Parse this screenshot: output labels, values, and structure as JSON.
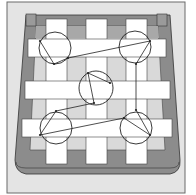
{
  "diagram": {
    "colors": {
      "background": "#ffffff",
      "panel": "#e4e4e4",
      "panel_border": "#6a6a6a",
      "frame_dark": "#8c8c8c",
      "frame_mid": "#a8a8a8",
      "slat": "#d9d9d9",
      "strap": "#ffffff",
      "line": "#222222"
    },
    "vertical_straps": [
      {
        "x": 46,
        "y": 19,
        "w": 21,
        "h": 145
      },
      {
        "x": 86,
        "y": 19,
        "w": 21,
        "h": 145
      },
      {
        "x": 126,
        "y": 19,
        "w": 21,
        "h": 145
      }
    ],
    "horizontal_straps": [
      {
        "x": 28,
        "y": 39,
        "w": 138,
        "h": 18
      },
      {
        "x": 25,
        "y": 81,
        "w": 145,
        "h": 18
      },
      {
        "x": 22,
        "y": 119,
        "w": 150,
        "h": 18
      }
    ],
    "circles": [
      {
        "id": "top-left",
        "cx": 55,
        "cy": 48,
        "r": 16
      },
      {
        "id": "top-right",
        "cx": 135,
        "cy": 47,
        "r": 16
      },
      {
        "id": "center",
        "cx": 96,
        "cy": 88,
        "r": 17
      },
      {
        "id": "bottom-left",
        "cx": 56,
        "cy": 128,
        "r": 16
      },
      {
        "id": "bottom-right",
        "cx": 136,
        "cy": 128,
        "r": 16
      }
    ],
    "path_points": [
      [
        40,
        41
      ],
      [
        54,
        64
      ],
      [
        68,
        58
      ],
      [
        150,
        41
      ],
      [
        136,
        64
      ],
      [
        136,
        110
      ],
      [
        150,
        135
      ],
      [
        124,
        118
      ],
      [
        40,
        135
      ],
      [
        56,
        111
      ],
      [
        94,
        103
      ],
      [
        88,
        73
      ],
      [
        110,
        83
      ]
    ]
  }
}
